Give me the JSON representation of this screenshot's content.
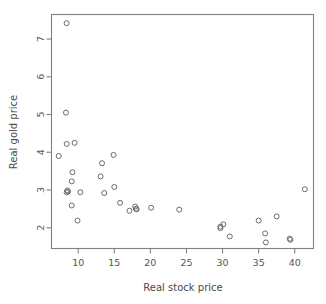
{
  "chart_data": {
    "type": "scatter",
    "title": "",
    "xlabel": "Real stock price",
    "ylabel": "Real gold price",
    "xlim": [
      6.3,
      42.6
    ],
    "ylim": [
      1.45,
      7.65
    ],
    "xticks": [
      10,
      15,
      20,
      25,
      30,
      35,
      40
    ],
    "xticklabels": [
      "10",
      "15",
      "20",
      "25",
      "30",
      "35",
      "40"
    ],
    "yticks": [
      2,
      3,
      4,
      5,
      6,
      7
    ],
    "yticklabels": [
      "2",
      "3",
      "4",
      "5",
      "6",
      "7"
    ],
    "grid": false,
    "legend": null,
    "marker": "open-circle",
    "marker_color": "#6b6b6b",
    "points": [
      {
        "x": 8.4,
        "y": 7.42
      },
      {
        "x": 8.3,
        "y": 5.05
      },
      {
        "x": 8.4,
        "y": 4.22
      },
      {
        "x": 9.5,
        "y": 4.25
      },
      {
        "x": 7.3,
        "y": 3.9
      },
      {
        "x": 9.2,
        "y": 3.47
      },
      {
        "x": 9.1,
        "y": 3.23
      },
      {
        "x": 8.5,
        "y": 2.99
      },
      {
        "x": 8.6,
        "y": 2.96
      },
      {
        "x": 8.4,
        "y": 2.94
      },
      {
        "x": 10.3,
        "y": 2.94
      },
      {
        "x": 9.1,
        "y": 2.59
      },
      {
        "x": 9.9,
        "y": 2.19
      },
      {
        "x": 14.9,
        "y": 3.93
      },
      {
        "x": 13.3,
        "y": 3.71
      },
      {
        "x": 13.1,
        "y": 3.36
      },
      {
        "x": 15.0,
        "y": 3.08
      },
      {
        "x": 13.6,
        "y": 2.92
      },
      {
        "x": 15.8,
        "y": 2.66
      },
      {
        "x": 17.1,
        "y": 2.45
      },
      {
        "x": 17.9,
        "y": 2.56
      },
      {
        "x": 18.0,
        "y": 2.5
      },
      {
        "x": 18.1,
        "y": 2.49
      },
      {
        "x": 20.1,
        "y": 2.53
      },
      {
        "x": 24.0,
        "y": 2.48
      },
      {
        "x": 29.7,
        "y": 2.03
      },
      {
        "x": 29.7,
        "y": 1.99
      },
      {
        "x": 30.1,
        "y": 2.09
      },
      {
        "x": 31.0,
        "y": 1.77
      },
      {
        "x": 35.0,
        "y": 2.19
      },
      {
        "x": 35.9,
        "y": 1.85
      },
      {
        "x": 36.0,
        "y": 1.61
      },
      {
        "x": 37.5,
        "y": 2.3
      },
      {
        "x": 39.3,
        "y": 1.71
      },
      {
        "x": 39.4,
        "y": 1.68
      },
      {
        "x": 41.4,
        "y": 3.02
      }
    ]
  },
  "figure": {
    "background_color": "#ffffff",
    "frame_color": "#808080",
    "text_color": "#4d4d4d"
  }
}
